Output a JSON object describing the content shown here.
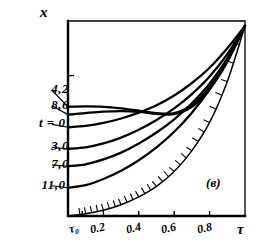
{
  "figure": {
    "panel_label": "(в)",
    "y_axis_label": "x",
    "x_axis_label": "τ",
    "background_color": "#ffffff",
    "ink_color": "#000000"
  },
  "chart_data": {
    "type": "line",
    "title": "",
    "subtitle": "",
    "xlabel": "τ",
    "ylabel": "x",
    "xlim": [
      0,
      1
    ],
    "ylim": [
      0,
      1
    ],
    "grid": false,
    "legend": "inline-left-leader-labels",
    "x_tick_labels": [
      "τ₀",
      "0.2",
      "0.4",
      "0.6",
      "0.8",
      "τ"
    ],
    "x_tick_values": [
      0.08,
      0.2,
      0.4,
      0.6,
      0.8,
      1.0
    ],
    "y_tick_labels": [],
    "y_tick_values": [
      0.72,
      0.52
    ],
    "annotations": [
      {
        "text": "(в)",
        "x": 0.78,
        "y": 0.18
      }
    ],
    "series": [
      {
        "name": "4.2",
        "label": "4,2",
        "label_x": 0.04,
        "label_y": 0.645,
        "x": [
          0.0,
          0.1,
          0.2,
          0.3,
          0.4,
          0.5,
          0.6,
          0.7,
          0.8,
          0.9,
          1.0
        ],
        "y": [
          0.56,
          0.562,
          0.56,
          0.552,
          0.54,
          0.527,
          0.528,
          0.57,
          0.66,
          0.8,
          0.975
        ]
      },
      {
        "name": "8.6",
        "label": "8,6",
        "label_x": 0.04,
        "label_y": 0.565,
        "x": [
          0.0,
          0.1,
          0.2,
          0.3,
          0.4,
          0.5,
          0.6,
          0.7,
          0.8,
          0.9,
          1.0
        ],
        "y": [
          0.52,
          0.528,
          0.535,
          0.538,
          0.534,
          0.524,
          0.522,
          0.56,
          0.65,
          0.79,
          0.975
        ]
      },
      {
        "name": "0",
        "label": "t = 0",
        "label_x": 0.02,
        "label_y": 0.47,
        "x": [
          0.0,
          0.1,
          0.2,
          0.3,
          0.4,
          0.5,
          0.6,
          0.7,
          0.8,
          0.9,
          1.0
        ],
        "y": [
          0.455,
          0.462,
          0.477,
          0.5,
          0.53,
          0.568,
          0.618,
          0.682,
          0.76,
          0.86,
          0.975
        ]
      },
      {
        "name": "3.0",
        "label": "3,0",
        "label_x": 0.04,
        "label_y": 0.352,
        "x": [
          0.0,
          0.1,
          0.2,
          0.3,
          0.4,
          0.5,
          0.6,
          0.7,
          0.8,
          0.9,
          1.0
        ],
        "y": [
          0.345,
          0.352,
          0.372,
          0.402,
          0.442,
          0.492,
          0.552,
          0.625,
          0.715,
          0.83,
          0.975
        ]
      },
      {
        "name": "7.0",
        "label": "7,0",
        "label_x": 0.04,
        "label_y": 0.262,
        "x": [
          0.0,
          0.1,
          0.2,
          0.3,
          0.4,
          0.5,
          0.6,
          0.7,
          0.8,
          0.9,
          1.0
        ],
        "y": [
          0.255,
          0.265,
          0.29,
          0.325,
          0.372,
          0.428,
          0.496,
          0.578,
          0.678,
          0.808,
          0.975
        ]
      },
      {
        "name": "11.0",
        "label": "11,0",
        "label_x": 0.02,
        "label_y": 0.155,
        "x": [
          0.0,
          0.1,
          0.2,
          0.3,
          0.4,
          0.5,
          0.6,
          0.7,
          0.8,
          0.9,
          1.0
        ],
        "y": [
          0.145,
          0.158,
          0.19,
          0.232,
          0.286,
          0.352,
          0.432,
          0.53,
          0.65,
          0.8,
          0.975
        ]
      },
      {
        "name": "boundary",
        "label": "",
        "hatched": true,
        "x": [
          0.0,
          0.1,
          0.2,
          0.3,
          0.4,
          0.5,
          0.6,
          0.7,
          0.8,
          0.9,
          1.0
        ],
        "y": [
          0.0,
          0.012,
          0.03,
          0.058,
          0.098,
          0.152,
          0.228,
          0.335,
          0.48,
          0.69,
          0.975
        ]
      }
    ]
  }
}
